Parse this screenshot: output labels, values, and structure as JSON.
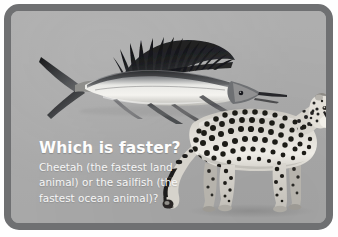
{
  "card": {
    "border_color": "#6f7072",
    "background_color": "#adadad",
    "outer_background": "#ffffff"
  },
  "content": {
    "headline": "Which is faster?",
    "body_lines": [
      "Cheetah (the fastest land",
      "animal) or the sailfish (the",
      "fastest ocean animal)?"
    ],
    "body_text": "Cheetah (the fastest land animal) or the sailfish (the fastest ocean animal)?",
    "text_color": "#fdfdfd"
  },
  "images": {
    "sailfish": {
      "label": "sailfish-photo",
      "description": "Grayscale photograph of a sailfish facing right with a long pointed bill, tall black ray-finned dorsal sail and a forked crescent tail",
      "body_color": "#e8e8e6",
      "fin_color": "#1d1d1f"
    },
    "cheetah": {
      "label": "cheetah-photo",
      "description": "Grayscale photograph of a spotted cheetah standing in profile facing right with a long banded tail",
      "coat_color": "#d9d6cf",
      "spot_color": "#1c1a18"
    }
  }
}
